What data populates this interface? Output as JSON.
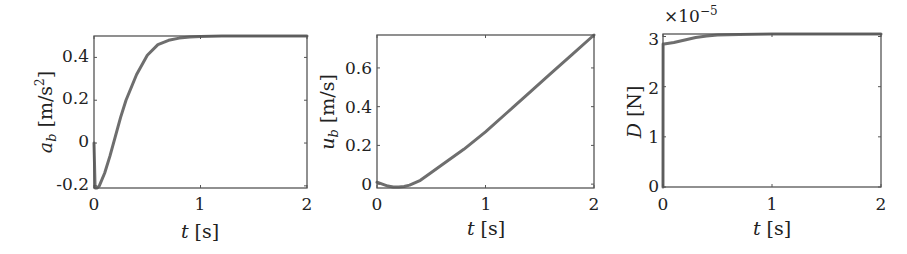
{
  "figure": {
    "panels": [
      {
        "id": "ab",
        "ylabel_symbol": "a",
        "ylabel_sub": "b",
        "ylabel_unit": "[m/s",
        "ylabel_unit_sup": "2",
        "ylabel_unit_close": "]",
        "xlabel_symbol": "t",
        "xlabel_unit": "[s]",
        "xticks": [
          "0",
          "1",
          "2"
        ],
        "yticks": [
          "-0.2",
          "0",
          "0.2",
          "0.4"
        ],
        "multiplier": ""
      },
      {
        "id": "ub",
        "ylabel_symbol": "u",
        "ylabel_sub": "b",
        "ylabel_unit": "[m/s]",
        "xlabel_symbol": "t",
        "xlabel_unit": "[s]",
        "xticks": [
          "0",
          "1",
          "2"
        ],
        "yticks": [
          "0",
          "0.2",
          "0.4",
          "0.6"
        ],
        "multiplier": ""
      },
      {
        "id": "D",
        "ylabel_symbol": "D",
        "ylabel_unit": "[N]",
        "xlabel_symbol": "t",
        "xlabel_unit": "[s]",
        "xticks": [
          "0",
          "1",
          "2"
        ],
        "yticks": [
          "0",
          "1",
          "2",
          "3"
        ],
        "multiplier": "×10",
        "multiplier_exp": "−5"
      }
    ],
    "line_color": "#6e6e6e",
    "axis_color": "#555555"
  },
  "chart_data": [
    {
      "type": "line",
      "title": "",
      "xlabel": "t [s]",
      "ylabel": "a_b [m/s^2]",
      "xlim": [
        0,
        2
      ],
      "ylim": [
        -0.21,
        0.5
      ],
      "grid": false,
      "series": [
        {
          "name": "a_b",
          "x": [
            0,
            0.01,
            0.03,
            0.05,
            0.1,
            0.15,
            0.2,
            0.25,
            0.3,
            0.4,
            0.5,
            0.6,
            0.7,
            0.8,
            0.9,
            1.0,
            1.2,
            1.5,
            2.0
          ],
          "y": [
            0.0,
            -0.21,
            -0.21,
            -0.2,
            -0.14,
            -0.06,
            0.03,
            0.12,
            0.2,
            0.32,
            0.41,
            0.46,
            0.48,
            0.49,
            0.495,
            0.498,
            0.5,
            0.5,
            0.5
          ]
        }
      ]
    },
    {
      "type": "line",
      "title": "",
      "xlabel": "t [s]",
      "ylabel": "u_b [m/s]",
      "xlim": [
        0,
        2
      ],
      "ylim": [
        -0.02,
        0.77
      ],
      "grid": false,
      "series": [
        {
          "name": "u_b",
          "x": [
            0,
            0.05,
            0.1,
            0.15,
            0.2,
            0.25,
            0.3,
            0.4,
            0.5,
            0.6,
            0.8,
            1.0,
            1.2,
            1.4,
            1.6,
            1.8,
            2.0
          ],
          "y": [
            0.01,
            0.0,
            -0.01,
            -0.015,
            -0.015,
            -0.012,
            -0.005,
            0.02,
            0.06,
            0.1,
            0.18,
            0.27,
            0.37,
            0.47,
            0.57,
            0.67,
            0.77
          ]
        }
      ]
    },
    {
      "type": "line",
      "title": "",
      "xlabel": "t [s]",
      "ylabel": "D [N]",
      "multiplier": "1e-5",
      "xlim": [
        0,
        2
      ],
      "ylim": [
        0,
        3.05
      ],
      "grid": false,
      "series": [
        {
          "name": "D",
          "x": [
            0,
            0.001,
            0.01,
            0.1,
            0.2,
            0.3,
            0.4,
            0.5,
            0.7,
            1.0,
            1.5,
            2.0
          ],
          "y": [
            0,
            2.85,
            2.85,
            2.88,
            2.93,
            2.98,
            3.01,
            3.03,
            3.04,
            3.05,
            3.05,
            3.05
          ]
        }
      ]
    }
  ]
}
